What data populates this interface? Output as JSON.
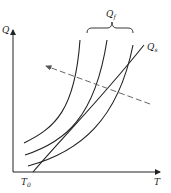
{
  "diagram": {
    "type": "heat-balance-curves",
    "axes": {
      "y_label": "Q",
      "x_label": "T",
      "origin_tick_label": "T",
      "origin_tick_sub": "0"
    },
    "curves": {
      "group_label": "Q",
      "group_label_sub": "f",
      "count": 3,
      "line_label": "Q",
      "line_label_sub": "s"
    },
    "arrow": {
      "style": "dashed",
      "direction": "up-left"
    },
    "colors": {
      "line": "#222222",
      "dashed": "#555555",
      "background": "#ffffff"
    }
  }
}
